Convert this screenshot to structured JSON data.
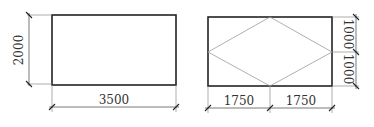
{
  "figures": [
    {
      "name": "plain-rectangle",
      "dimensions": {
        "height_label": "2000",
        "width_label": "3500"
      }
    },
    {
      "name": "rectangle-with-rhombus",
      "dimensions": {
        "right_upper_label": "1000",
        "right_lower_label": "1000",
        "bottom_left_label": "1750",
        "bottom_right_label": "1750"
      }
    }
  ],
  "colors": {
    "outline": "#222222",
    "dimension_line": "#555555",
    "rhombus_line": "#9a9a9a"
  }
}
